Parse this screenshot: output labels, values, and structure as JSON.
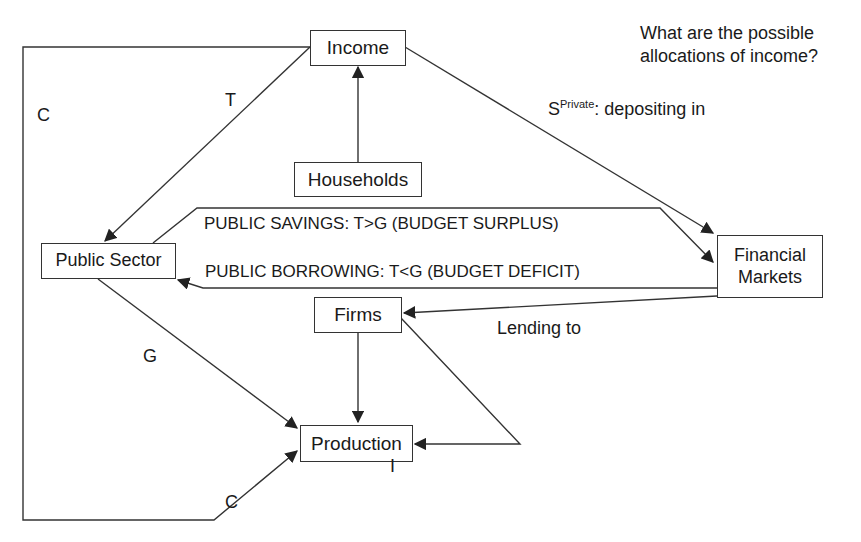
{
  "question": [
    "What are the possible",
    "allocations of income?"
  ],
  "nodes": {
    "income": "Income",
    "households": "Households",
    "public_sector": "Public Sector",
    "financial_markets": [
      "Financial",
      "Markets"
    ],
    "firms": "Firms",
    "production": "Production"
  },
  "edge_labels": {
    "consumption_loop": "C",
    "taxes": "T",
    "private_savings_symbol": "S",
    "private_savings_superscript": "Private",
    "private_savings_text": ": depositing in",
    "public_savings": "PUBLIC SAVINGS: T>G (BUDGET SURPLUS)",
    "public_borrowing": "PUBLIC BORROWING: T<G (BUDGET DEFICIT)",
    "lending": "Lending to",
    "government_spending": "G",
    "investment": "I",
    "consumption_to_production": "C"
  },
  "colors": {
    "line": "#333333",
    "text": "#1a1a1a",
    "background": "#ffffff"
  }
}
